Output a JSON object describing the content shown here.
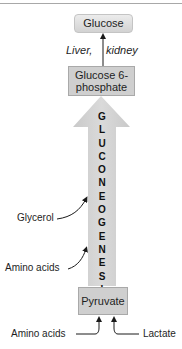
{
  "diagram": {
    "colors": {
      "box_fill": "#cfcfcf",
      "box_border": "#a9a9a9",
      "glucose_fill_top": "#ececec",
      "glucose_fill_bottom": "#d2d2d2",
      "arrow_fill": "#cdcdcd",
      "line": "#1a1a1a"
    },
    "nodes": {
      "glucose": "Glucose",
      "glucose6p_line1": "Glucose 6-",
      "glucose6p_line2": "phosphate",
      "pyruvate": "Pyruvate"
    },
    "edge_labels": {
      "liver": "Liver,",
      "kidney": "kidney"
    },
    "pathway_label": [
      "G",
      "L",
      "U",
      "C",
      "O",
      "N",
      "E",
      "O",
      "G",
      "E",
      "N",
      "E",
      "S",
      "I",
      "S"
    ],
    "inputs": {
      "glycerol": "Glycerol",
      "amino_acids_mid": "Amino acids",
      "amino_acids_bottom": "Amino acids",
      "lactate": "Lactate"
    }
  }
}
